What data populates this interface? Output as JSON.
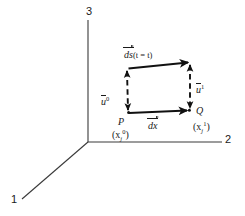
{
  "figure": {
    "background": "#ffffff",
    "ink": "#1a1a1a",
    "axes": {
      "label_3": "3",
      "label_2": "2",
      "label_1": "1",
      "origin": [
        88,
        142
      ]
    },
    "labels": {
      "ds": "ds",
      "ds_paren": "(t = t)",
      "u0_base": "u",
      "u0_sup": "0",
      "u1_base": "u",
      "u1_sup": "1",
      "dx": "dx",
      "point_P": "P",
      "point_P_coord_open": "(x",
      "point_P_coord_sub": "j",
      "point_P_coord_sup": "0",
      "point_P_coord_close": ")",
      "point_Q": "Q",
      "point_Q_coord_open": "(x",
      "point_Q_coord_sub": "j",
      "point_Q_coord_sup": "1",
      "point_Q_coord_close": ")"
    },
    "geometry": {
      "P": [
        128,
        113
      ],
      "Q": [
        189,
        110
      ],
      "top_left": [
        128,
        68
      ],
      "top_right": [
        190,
        62
      ]
    }
  }
}
